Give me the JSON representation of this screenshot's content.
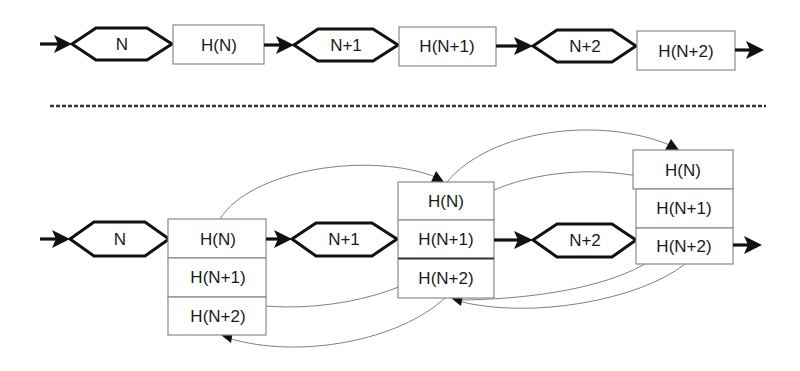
{
  "diagram": {
    "top_row": {
      "nodes": [
        {
          "label": "N"
        },
        {
          "label": "N+1"
        },
        {
          "label": "N+2"
        }
      ],
      "hashes": [
        {
          "label": "H(N)"
        },
        {
          "label": "H(N+1)"
        },
        {
          "label": "H(N+2)"
        }
      ]
    },
    "separator": "dashed-line",
    "bottom_row": {
      "nodes": [
        {
          "label": "N"
        },
        {
          "label": "N+1"
        },
        {
          "label": "N+2"
        }
      ],
      "stacks": [
        {
          "cells": [
            {
              "label": "H(N)"
            },
            {
              "label": "H(N+1)"
            },
            {
              "label": "H(N+2)"
            }
          ]
        },
        {
          "cells": [
            {
              "label": "H(N)"
            },
            {
              "label": "H(N+1)"
            },
            {
              "label": "H(N+2)"
            }
          ]
        },
        {
          "cells": [
            {
              "label": "H(N)"
            },
            {
              "label": "H(N+1)"
            },
            {
              "label": "H(N+2)"
            }
          ]
        }
      ]
    },
    "colors": {
      "hex_stroke": "#111111",
      "box_stroke": "#8a8a8a",
      "curve_stroke": "#808080",
      "background": "#ffffff"
    }
  }
}
